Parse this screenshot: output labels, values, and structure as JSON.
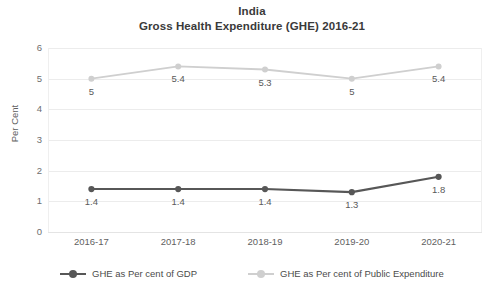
{
  "chart_data": {
    "type": "line",
    "title": "India",
    "subtitle": "Gross Health Expenditure (GHE) 2016-21",
    "xlabel": "",
    "ylabel": "Per Cent",
    "categories": [
      "2016-17",
      "2017-18",
      "2018-19",
      "2019-20",
      "2020-21"
    ],
    "ylim": [
      0,
      6
    ],
    "yticks": [
      "0",
      "1",
      "2",
      "3",
      "4",
      "5",
      "6"
    ],
    "grid": true,
    "legend_position": "bottom",
    "series": [
      {
        "name": "GHE as Per cent of GDP",
        "color": "#575757",
        "values": [
          1.4,
          1.4,
          1.4,
          1.3,
          1.8
        ],
        "labels": [
          "1.4",
          "1.4",
          "1.4",
          "1.3",
          "1.8"
        ],
        "label_position": "below"
      },
      {
        "name": "GHE as Per cent of Public Expenditure",
        "color": "#cfcfcf",
        "values": [
          5,
          5.4,
          5.3,
          5,
          5.4
        ],
        "labels": [
          "5",
          "5.4",
          "5.3",
          "5",
          "5.4"
        ],
        "label_position": "below"
      }
    ]
  },
  "titles": {
    "line1": "India",
    "line2": "Gross Health Expenditure (GHE) 2016-21"
  },
  "axes": {
    "y_label": "Per Cent",
    "y_ticks": [
      "6",
      "5",
      "4",
      "3",
      "2",
      "1",
      "0"
    ],
    "x_ticks": [
      "2016-17",
      "2017-18",
      "2018-19",
      "2019-20",
      "2020-21"
    ]
  },
  "legend": {
    "items": [
      {
        "label": "GHE as Per cent of GDP",
        "color": "#575757"
      },
      {
        "label": "GHE as Per cent of Public Expenditure",
        "color": "#cfcfcf"
      }
    ]
  },
  "colors": {
    "series_gdp": "#575757",
    "series_public_expenditure": "#cfcfcf",
    "gridline": "#ececec",
    "text": "#5a5a5a",
    "background": "#ffffff"
  }
}
